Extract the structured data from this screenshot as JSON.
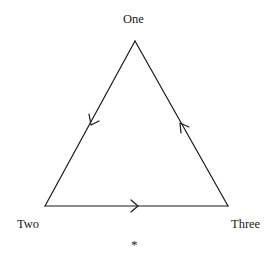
{
  "diagram": {
    "nodes": [
      {
        "id": "one",
        "label": "One"
      },
      {
        "id": "two",
        "label": "Two"
      },
      {
        "id": "three",
        "label": "Three"
      }
    ],
    "edges": [
      {
        "from": "one",
        "to": "two",
        "direction": "arrow toward Two"
      },
      {
        "from": "two",
        "to": "three",
        "direction": "arrow toward Three"
      },
      {
        "from": "three",
        "to": "one",
        "direction": "arrow toward One"
      }
    ],
    "footnote_mark": "*",
    "line_color": "#1a1a1a"
  }
}
